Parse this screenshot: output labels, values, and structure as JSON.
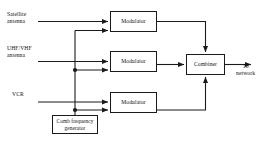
{
  "diagram": {
    "stroke_color": "#1a1a1a",
    "text_color": "#111111",
    "background": "#ffffff",
    "inputs": [
      {
        "id": "satellite",
        "label": "Satellite\nantenna",
        "line1": "Satellite",
        "line2": "antenna"
      },
      {
        "id": "uhfvhf",
        "label": "UHF/VHF\nantenna",
        "line1": "UHF/VHF",
        "line2": "antenna"
      },
      {
        "id": "vcr",
        "label": "VCR",
        "line1": "VCR",
        "line2": ""
      }
    ],
    "blocks": {
      "modulator_1": "Modulator",
      "modulator_2": "Modulator",
      "modulator_3": "Modulator",
      "combiner": "Combiner",
      "comb_generator_line1": "Comb frequency",
      "comb_generator_line2": "generator"
    },
    "outputs": [
      {
        "id": "to-network",
        "line1": "To",
        "line2": "network"
      }
    ]
  }
}
